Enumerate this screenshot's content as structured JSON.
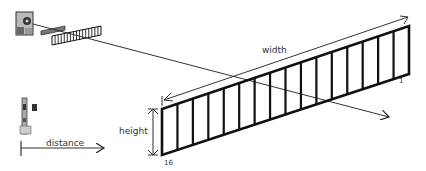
{
  "diagram": {
    "labels": {
      "width": "width",
      "height": "height",
      "distance": "distance",
      "first_panel": "1",
      "last_panel": "16"
    },
    "panel_count": 16,
    "colors": {
      "line": "#111111",
      "device": "#555555",
      "background": "#ffffff"
    }
  }
}
